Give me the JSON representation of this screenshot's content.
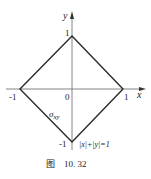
{
  "figure": {
    "axes": {
      "x_label": "x",
      "y_label": "y",
      "origin_label": "0"
    },
    "ticks": {
      "x_neg": "-1",
      "x_pos": "1",
      "y_pos": "1",
      "y_neg": "-1"
    },
    "region_label": "σ",
    "region_label_sub": "xy",
    "equation": "|x|+|y|=1",
    "caption_prefix": "图",
    "caption_number": "10. 32",
    "colors": {
      "line": "#2a2a2a",
      "axis": "#555555"
    }
  }
}
